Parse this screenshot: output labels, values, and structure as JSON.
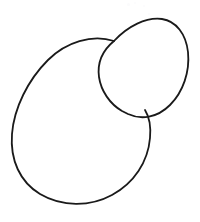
{
  "canvas": {
    "width": 200,
    "height": 222,
    "background_color": "#ffffff",
    "description": "Hand-drawn line diagram of two overlapping ellipses"
  },
  "style": {
    "stroke_color": "#1a1a1a",
    "stroke_width": 1.7,
    "fill": "none"
  },
  "shapes": [
    {
      "name": "large-ellipse",
      "label": "Large ellipse",
      "center_x": 80,
      "center_y": 122,
      "radius_x": 70,
      "radius_y": 52,
      "rotation_deg": -40,
      "stroke_color": "#1a1a1a",
      "stroke_width": 1.8,
      "path": "M 114 41 C 92 34 66 42 48 60 C 28 80 14 108 12 134 C 10 160 20 182 40 194 C 62 207 90 207 112 195 C 134 183 148 162 150 138 C 151 127 150 118 145 110"
    },
    {
      "name": "small-ellipse",
      "label": "Small ellipse",
      "center_x": 144,
      "center_y": 65,
      "radius_x": 44,
      "radius_y": 30,
      "rotation_deg": -62,
      "stroke_color": "#1a1a1a",
      "stroke_width": 1.8,
      "path": "M 114 41 C 128 26 146 17 162 19 C 176 21 186 34 188 52 C 190 72 183 92 170 105 C 157 118 141 120 128 114 C 126 113 124 112 122 111 C 110 104 101 91 99 77 C 97 62 103 50 114 41"
    }
  ],
  "intersections": [
    {
      "name": "upper-intersection",
      "x": 114,
      "y": 41
    },
    {
      "name": "lower-intersection",
      "x": 145,
      "y": 110
    }
  ],
  "specks": [
    {
      "x": 127,
      "y": 3,
      "size": 3
    },
    {
      "x": 134,
      "y": 2,
      "size": 2
    },
    {
      "x": 143,
      "y": 5,
      "size": 2
    },
    {
      "x": 148,
      "y": 13,
      "size": 2
    }
  ]
}
